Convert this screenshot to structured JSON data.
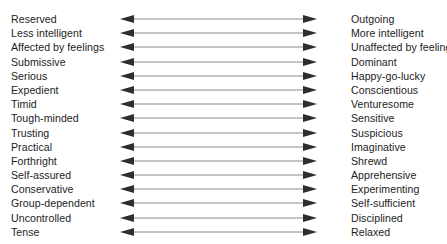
{
  "figure": {
    "type": "bipolar-trait-scale",
    "background_color": "#ffffff",
    "text_color": "#1d1d1d",
    "arrow_shaft_color": "#8a8a8a",
    "arrow_head_color": "#2e2e2e",
    "arrow_icon_name": "double-headed-arrow-icon"
  },
  "rows": [
    {
      "left": "Reserved",
      "right": "Outgoing"
    },
    {
      "left": "Less intelligent",
      "right": "More intelligent"
    },
    {
      "left": "Affected by feelings",
      "right": "Unaffected by feelings"
    },
    {
      "left": "Submissive",
      "right": "Dominant"
    },
    {
      "left": "Serious",
      "right": "Happy-go-lucky"
    },
    {
      "left": "Expedient",
      "right": "Conscientious"
    },
    {
      "left": "Timid",
      "right": "Venturesome"
    },
    {
      "left": "Tough-minded",
      "right": "Sensitive"
    },
    {
      "left": "Trusting",
      "right": "Suspicious"
    },
    {
      "left": "Practical",
      "right": "Imaginative"
    },
    {
      "left": "Forthright",
      "right": "Shrewd"
    },
    {
      "left": "Self-assured",
      "right": "Apprehensive"
    },
    {
      "left": "Conservative",
      "right": "Experimenting"
    },
    {
      "left": "Group-dependent",
      "right": "Self-sufficient"
    },
    {
      "left": "Uncontrolled",
      "right": "Disciplined"
    },
    {
      "left": "Tense",
      "right": "Relaxed"
    }
  ]
}
